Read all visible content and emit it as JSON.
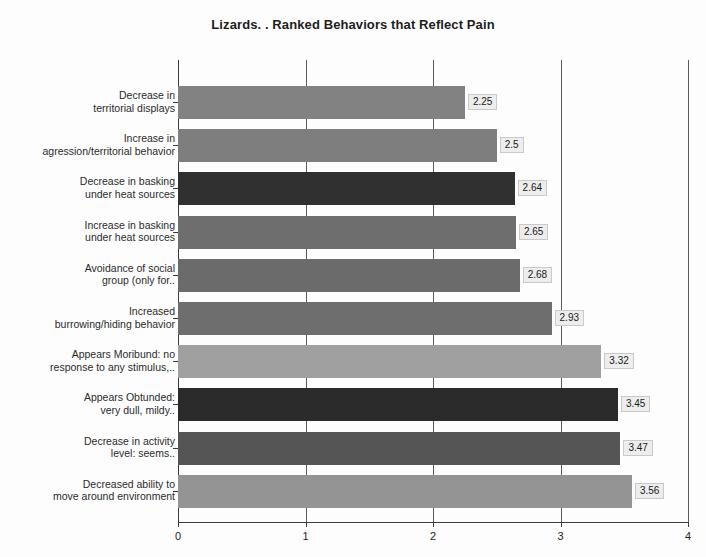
{
  "chart_data": {
    "type": "bar",
    "orientation": "horizontal",
    "title": "Lizards. . Ranked Behaviors that Reflect Pain",
    "xlabel": "",
    "ylabel": "",
    "xlim": [
      0,
      4
    ],
    "xticks": [
      "0",
      "1",
      "2",
      "3",
      "4"
    ],
    "grid": true,
    "legend": "none",
    "categories": [
      "Decrease in territorial displays",
      "Increase in agression/territorial behavior",
      "Decrease in basking under heat sources",
      "Increase in basking under heat sources",
      "Avoidance of social group (only for...",
      "Increased burrowing/hiding behavior",
      "Appears Moribund: no response to any stimulus,...",
      "Appears Obtunded: very dull, mildy...",
      "Decrease in activity level: seems...",
      "Decreased ability to move around environment"
    ],
    "category_lines": [
      [
        "Decrease in",
        "territorial displays"
      ],
      [
        "Increase in",
        "agression/territorial behavior"
      ],
      [
        "Decrease in basking",
        "under heat sources"
      ],
      [
        "Increase in basking",
        "under heat sources"
      ],
      [
        "Avoidance of social",
        "group (only for.."
      ],
      [
        "Increased",
        "burrowing/hiding behavior"
      ],
      [
        "Appears Moribund: no",
        "response to any stimulus,.."
      ],
      [
        "Appears Obtunded:",
        "very dull, mildy.."
      ],
      [
        "Decrease in activity",
        "level: seems.."
      ],
      [
        "Decreased ability to",
        "move around environment"
      ]
    ],
    "values": [
      2.25,
      2.5,
      2.64,
      2.65,
      2.68,
      2.93,
      3.32,
      3.45,
      3.47,
      3.56
    ],
    "value_labels": [
      "2.25",
      "2.5",
      "2.64",
      "2.65",
      "2.68",
      "2.93",
      "3.32",
      "3.45",
      "3.47",
      "3.56"
    ],
    "bar_colors": [
      "#828282",
      "#7e7e7e",
      "#303030",
      "#6e6e6e",
      "#6b6b6b",
      "#6e6e6e",
      "#a0a0a0",
      "#2b2b2b",
      "#555555",
      "#949494"
    ]
  }
}
